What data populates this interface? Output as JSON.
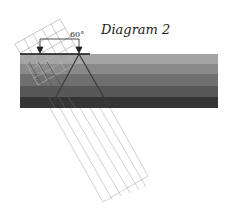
{
  "diagram": {
    "title": "Diagram 2",
    "angle_label": "60°",
    "layers": {
      "x": 20,
      "y": 54,
      "width": 198,
      "height": 54,
      "bands": [
        {
          "color": "#a4a4a4",
          "height": 10
        },
        {
          "color": "#8a8a8a",
          "height": 10
        },
        {
          "color": "#6f6f6f",
          "height": 12
        },
        {
          "color": "#575757",
          "height": 11
        },
        {
          "color": "#353535",
          "height": 11
        }
      ]
    },
    "surface_line": {
      "x1": 20,
      "y1": 54,
      "x2": 90,
      "y2": 54,
      "color": "#111111"
    },
    "arrows": [
      {
        "x": 40,
        "y1": 39,
        "y2": 52
      },
      {
        "x": 79,
        "y1": 39,
        "y2": 52
      }
    ],
    "bracket": {
      "x1": 40,
      "x2": 79,
      "y": 39
    },
    "colors": {
      "grid": "#aaaaaa",
      "ray": "#444444",
      "outline": "#bbbbbb"
    }
  }
}
